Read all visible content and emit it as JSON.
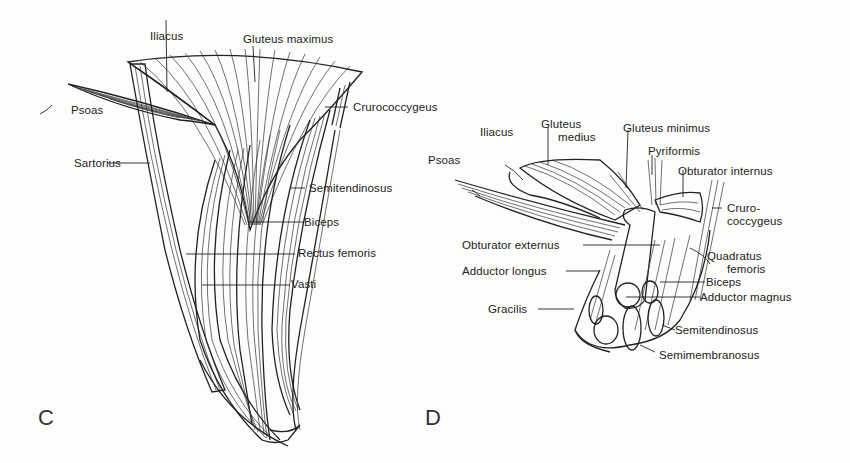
{
  "figure": {
    "type": "anatomical illustration",
    "background": "#fdfdfc",
    "ink": "#222222"
  },
  "panels": [
    {
      "id": "C",
      "letter": "C",
      "labels": {
        "iliacus": "Iliacus",
        "gluteus_maximus": "Gluteus maximus",
        "psoas": "Psoas",
        "crurococcygeus": "Crurococcygeus",
        "sartorius": "Sartorius",
        "semitendinosus": "Semitendinosus",
        "biceps": "Biceps",
        "rectus_femoris": "Rectus femoris",
        "vasti": "Vasti"
      }
    },
    {
      "id": "D",
      "letter": "D",
      "labels": {
        "iliacus": "Iliacus",
        "gluteus_medius_1": "Gluteus",
        "gluteus_medius_2": "medius",
        "gluteus_minimus": "Gluteus minimus",
        "psoas": "Psoas",
        "pyriformis": "Pyriformis",
        "obturator_internus": "Obturator internus",
        "crurococcygeus_1": "Cruro-",
        "crurococcygeus_2": "coccygeus",
        "obturator_externus": "Obturator externus",
        "quadratus_femoris_1": "Quadratus",
        "quadratus_femoris_2": "femoris",
        "adductor_longus": "Adductor longus",
        "biceps": "Biceps",
        "adductor_magnus": "Adductor magnus",
        "gracilis": "Gracilis",
        "semitendinosus": "Semitendinosus",
        "semimembranosus": "Semimembranosus"
      }
    }
  ]
}
